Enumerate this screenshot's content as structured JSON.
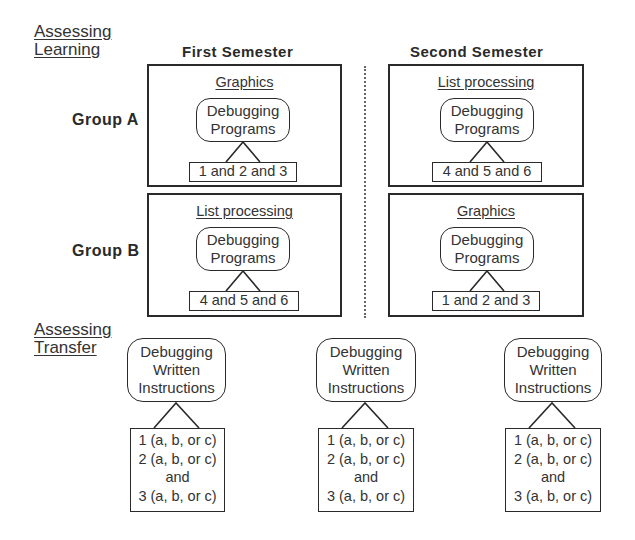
{
  "sections": {
    "learning": {
      "line1": "Assessing",
      "line2": "Learning"
    },
    "transfer": {
      "line1": "Assessing",
      "line2": "Transfer"
    }
  },
  "columns": {
    "first": "First Semester",
    "second": "Second Semester"
  },
  "groups": {
    "a": "Group A",
    "b": "Group B"
  },
  "cells": {
    "a_first": {
      "topic": "Graphics",
      "task_line1": "Debugging",
      "task_line2": "Programs",
      "items": "1 and 2 and 3"
    },
    "a_second": {
      "topic": "List processing",
      "task_line1": "Debugging",
      "task_line2": "Programs",
      "items": "4 and 5 and 6"
    },
    "b_first": {
      "topic": "List processing",
      "task_line1": "Debugging",
      "task_line2": "Programs",
      "items": "4 and 5 and 6"
    },
    "b_second": {
      "topic": "Graphics",
      "task_line1": "Debugging",
      "task_line2": "Programs",
      "items": "1 and 2 and 3"
    }
  },
  "transfer_tests": [
    {
      "task_line1": "Debugging",
      "task_line2": "Written",
      "task_line3": "Instructions",
      "item1": "1 (a, b, or c)",
      "item2": "2 (a, b, or c)",
      "conj": "and",
      "item3": "3 (a, b, or c)"
    },
    {
      "task_line1": "Debugging",
      "task_line2": "Written",
      "task_line3": "Instructions",
      "item1": "1 (a, b, or c)",
      "item2": "2 (a, b, or c)",
      "conj": "and",
      "item3": "3 (a, b, or c)"
    },
    {
      "task_line1": "Debugging",
      "task_line2": "Written",
      "task_line3": "Instructions",
      "item1": "1 (a, b, or c)",
      "item2": "2 (a, b, or c)",
      "conj": "and",
      "item3": "3 (a, b, or c)"
    }
  ]
}
